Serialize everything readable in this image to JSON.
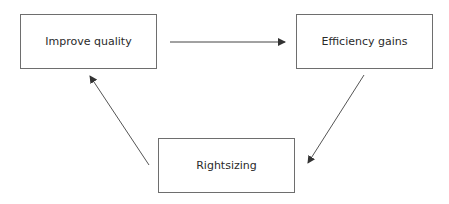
{
  "diagram": {
    "nodes": [
      {
        "id": "improve",
        "label": "Improve quality"
      },
      {
        "id": "efficiency",
        "label": "Efficiency gains"
      },
      {
        "id": "rightsizing",
        "label": "Rightsizing"
      }
    ],
    "edges": [
      {
        "from": "improve",
        "to": "efficiency"
      },
      {
        "from": "efficiency",
        "to": "rightsizing"
      },
      {
        "from": "rightsizing",
        "to": "improve"
      }
    ],
    "colors": {
      "stroke": "#6e6e6e",
      "text": "#2a2a2a"
    }
  }
}
